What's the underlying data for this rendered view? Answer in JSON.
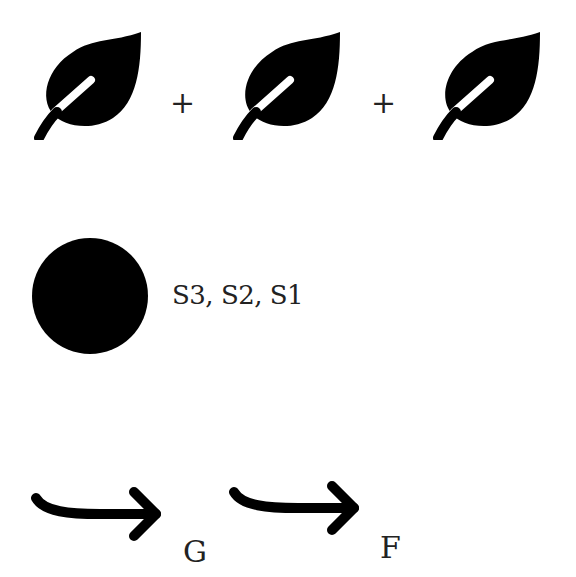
{
  "row1": {
    "items": [
      {
        "icon": "leaf-icon"
      },
      {
        "operator": "+"
      },
      {
        "icon": "leaf-icon"
      },
      {
        "operator": "+"
      },
      {
        "icon": "leaf-icon"
      }
    ]
  },
  "row2": {
    "icon": "filled-circle-icon",
    "label": "S3, S2, S1"
  },
  "row3": {
    "steps": [
      {
        "icon": "curved-arrow-right-icon",
        "label": "G"
      },
      {
        "icon": "curved-arrow-right-icon",
        "label": "F"
      }
    ]
  },
  "colors": {
    "foreground": "#000000",
    "background": "#ffffff",
    "text": "#222222"
  }
}
